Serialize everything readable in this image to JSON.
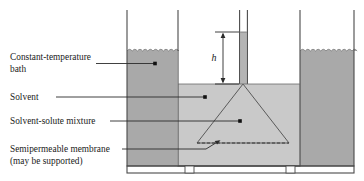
{
  "figure": {
    "type": "diagram"
  },
  "labels": {
    "bath_line1": "Constant-temperature",
    "bath_line2": "bath",
    "solvent": "Solvent",
    "mixture": "Solvent-solute mixture",
    "membrane_line1": "Semipermeable membrane",
    "membrane_line2": "(may be supported)",
    "height_symbol": "h"
  },
  "colors": {
    "bath_fill": "#a9a9a9",
    "solvent_fill": "#c9c9c9",
    "tube_fill": "#b4b4b4",
    "cone_fill": "#fbfbfb",
    "outline": "#4a4a4a",
    "text": "#1a1a1a",
    "background": "#ffffff"
  },
  "parts": {
    "outer_tank": "constant-temperature bath vessel",
    "inner_vessel": "solvent vessel",
    "cone": "solvent-solute mixture funnel",
    "capillary": "capillary riser tube",
    "membrane": "semipermeable membrane",
    "supports": "vessel support feet"
  }
}
